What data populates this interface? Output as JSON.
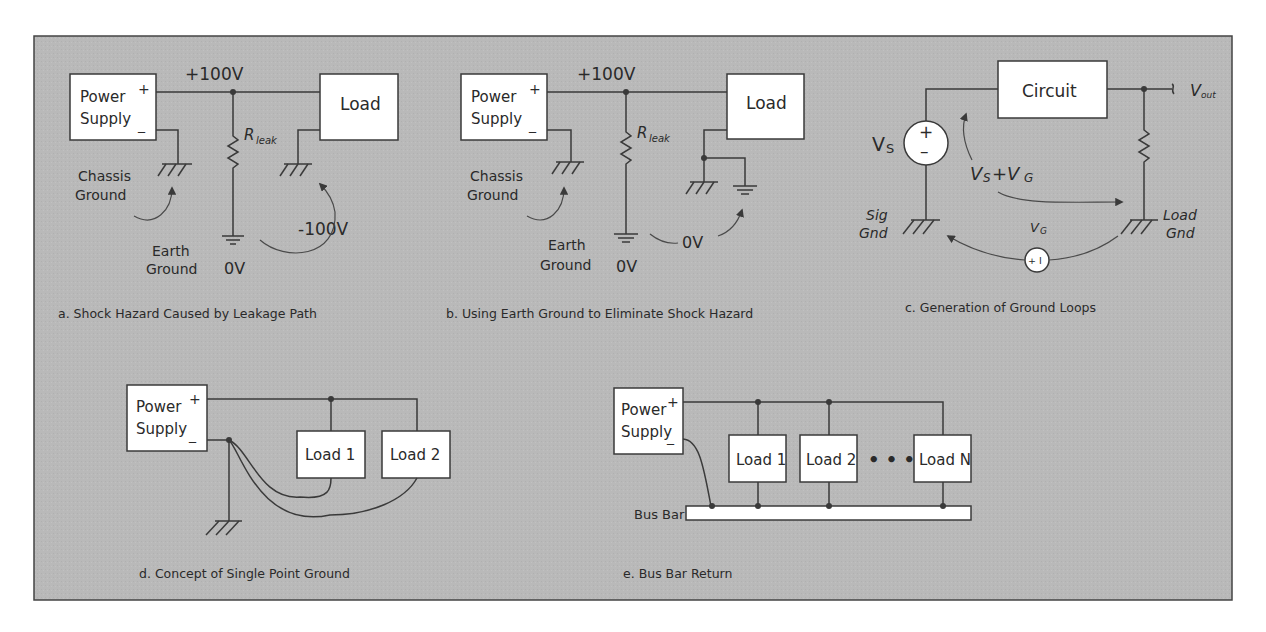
{
  "figure": {
    "frame_color": "#b8b8b8",
    "panels": {
      "a": {
        "caption": "a. Shock Hazard Caused by Leakage Path",
        "power_supply": [
          "Power",
          "Supply"
        ],
        "plus": "+",
        "minus": "_",
        "rail_voltage": "+100V",
        "load": "Load",
        "resistor": "R",
        "resistor_sub": "leak",
        "chassis_ground": [
          "Chassis",
          "Ground"
        ],
        "earth_ground": [
          "Earth",
          "Ground"
        ],
        "earth_voltage": "0V",
        "hazard_voltage": "-100V"
      },
      "b": {
        "caption": "b. Using Earth Ground to Eliminate Shock Hazard",
        "power_supply": [
          "Power",
          "Supply"
        ],
        "plus": "+",
        "minus": "_",
        "rail_voltage": "+100V",
        "load": "Load",
        "resistor": "R",
        "resistor_sub": "leak",
        "chassis_ground": [
          "Chassis",
          "Ground"
        ],
        "earth_ground": [
          "Earth",
          "Ground"
        ],
        "earth_voltage": "0V",
        "diff_voltage": "0V"
      },
      "c": {
        "caption": "c. Generation of Ground Loops",
        "circuit": "Circuit",
        "vout": "V",
        "vout_sub": "out",
        "vs": "V",
        "vs_sub": "S",
        "sum_label": "VS +VG",
        "sum_a": "V",
        "sum_a_sub": "S",
        "sum_plus": " +V",
        "sum_b_sub": "G",
        "vg": "V",
        "vg_sub": "G",
        "source_plus": "+",
        "source_minus": "–",
        "vg_source_label": "+ I",
        "sig_gnd": [
          "Sig",
          "Gnd"
        ],
        "load_gnd": [
          "Load",
          "Gnd"
        ]
      },
      "d": {
        "caption": "d. Concept of Single Point Ground",
        "power_supply": [
          "Power",
          "Supply"
        ],
        "plus": "+",
        "minus": "_",
        "loads": [
          "Load 1",
          "Load 2"
        ]
      },
      "e": {
        "caption": "e. Bus Bar Return",
        "power_supply": [
          "Power",
          "Supply"
        ],
        "plus": "+",
        "minus": "_",
        "loads": [
          "Load 1",
          "Load 2",
          "Load N"
        ],
        "ellipsis": "• • •",
        "bus_bar": "Bus Bar"
      }
    }
  }
}
